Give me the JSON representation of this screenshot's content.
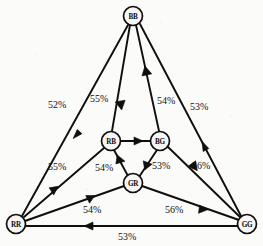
{
  "figure": {
    "type": "directed-graph",
    "background_color": "#fbfbfa",
    "ink_color": "#100f0d"
  },
  "nodes": [
    {
      "id": "BB",
      "label": "BB",
      "x": 133,
      "y": 16,
      "r": 9.5
    },
    {
      "id": "RB",
      "label": "RB",
      "x": 111,
      "y": 141,
      "r": 9.5
    },
    {
      "id": "BG",
      "label": "BG",
      "x": 160,
      "y": 141,
      "r": 9.5
    },
    {
      "id": "GR",
      "label": "GR",
      "x": 133,
      "y": 183,
      "r": 9.5
    },
    {
      "id": "RR",
      "label": "RR",
      "x": 16,
      "y": 224,
      "r": 9.5
    },
    {
      "id": "GG",
      "label": "GG",
      "x": 247,
      "y": 224,
      "r": 9.5
    }
  ],
  "edges": [
    {
      "id": "e1",
      "from": "RR",
      "to": "BB",
      "label": "52%",
      "label_x": 48,
      "label_y": 99
    },
    {
      "id": "e2",
      "from": "BB",
      "to": "RB",
      "label": "55%",
      "label_x": 90,
      "label_y": 93
    },
    {
      "id": "e3",
      "from": "BG",
      "to": "BB",
      "label": "54%",
      "label_x": 157,
      "label_y": 95
    },
    {
      "id": "e4",
      "from": "BB",
      "to": "GG",
      "label": "53%",
      "label_x": 190,
      "label_y": 101
    },
    {
      "id": "e5",
      "from": "RB",
      "to": "RR",
      "label": "55%",
      "label_x": 48,
      "label_y": 161
    },
    {
      "id": "e6",
      "from": "GR",
      "to": "RB",
      "label": "54%",
      "label_x": 95,
      "label_y": 162
    },
    {
      "id": "e7",
      "from": "BG",
      "to": "GR",
      "label": "53%",
      "label_x": 152,
      "label_y": 160
    },
    {
      "id": "e8",
      "from": "GG",
      "to": "BG",
      "label": "56%",
      "label_x": 192,
      "label_y": 160
    },
    {
      "id": "e9",
      "from": "RB",
      "to": "BG",
      "label": "",
      "label_x": 0,
      "label_y": 0
    },
    {
      "id": "e10",
      "from": "RR",
      "to": "GR",
      "label": "54%",
      "label_x": 83,
      "label_y": 204
    },
    {
      "id": "e11",
      "from": "GR",
      "to": "GG",
      "label": "56%",
      "label_x": 165,
      "label_y": 204
    },
    {
      "id": "e12",
      "from": "GG",
      "to": "RR",
      "label": "53%",
      "label_x": 118,
      "label_y": 231
    }
  ],
  "edge_labels": [
    "52%",
    "55%",
    "54%",
    "53%",
    "55%",
    "54%",
    "53%",
    "56%",
    "54%",
    "56%",
    "53%"
  ]
}
